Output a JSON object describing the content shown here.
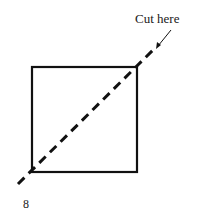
{
  "diagram": {
    "annotation": "Cut here",
    "page_number": "8",
    "square": {
      "x": 32,
      "y": 67,
      "size": 105
    },
    "cut_line": {
      "x1": 18,
      "y1": 184,
      "x2": 157,
      "y2": 46
    },
    "arrow": {
      "x1": 171,
      "y1": 30,
      "x2": 157,
      "y2": 47
    },
    "stroke_color": "#111111"
  }
}
